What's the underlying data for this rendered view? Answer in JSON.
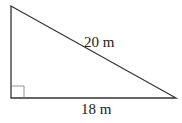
{
  "diagram": {
    "type": "right-triangle",
    "hypotenuse_label": "20 m",
    "base_label": "18 m",
    "right_angle_marker": "bottom-left",
    "stroke_color": "#333333"
  }
}
